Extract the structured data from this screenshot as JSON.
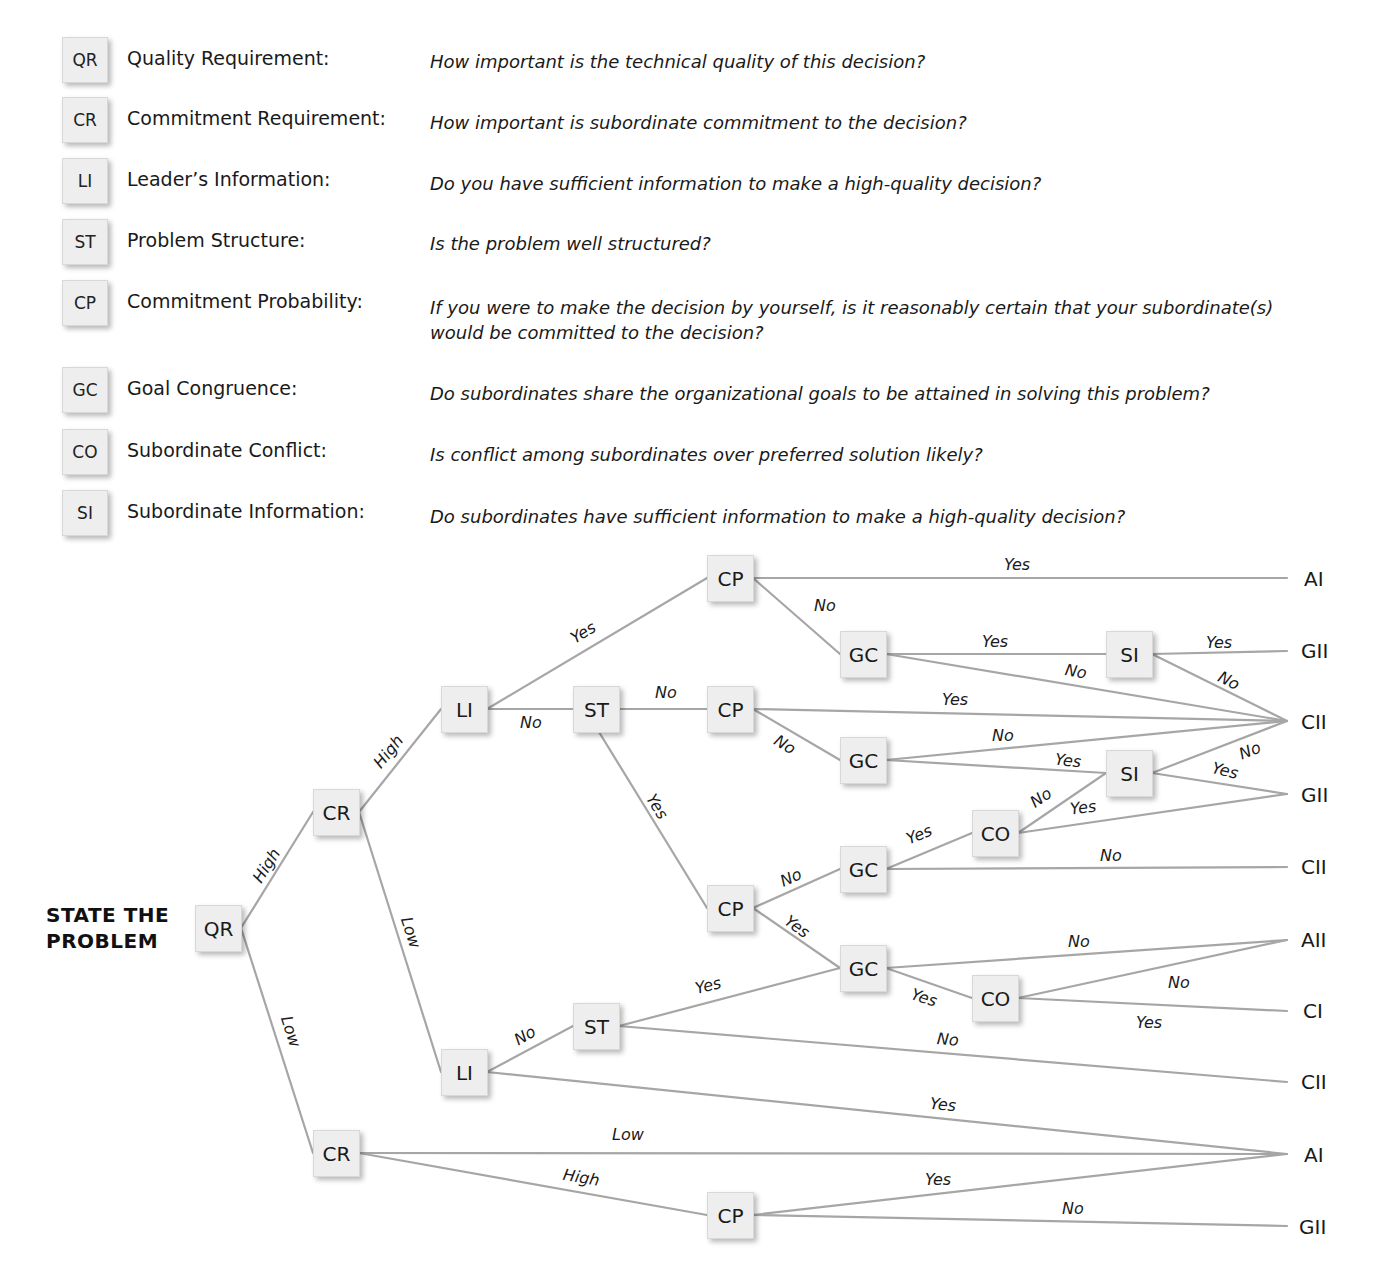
{
  "legend": [
    {
      "code": "QR",
      "name": "Quality Requirement:",
      "question": "How important is the technical quality of this decision?"
    },
    {
      "code": "CR",
      "name": "Commitment Requirement:",
      "question": "How important is subordinate commitment to the decision?"
    },
    {
      "code": "LI",
      "name": "Leader’s Information:",
      "question": "Do you have sufficient information to make a high-quality decision?"
    },
    {
      "code": "ST",
      "name": "Problem Structure:",
      "question": "Is the problem well structured?"
    },
    {
      "code": "CP",
      "name": "Commitment Probability:",
      "question": "If you were to make the decision by yourself, is it reasonably certain that your subordinate(s) would be committed to the decision?"
    },
    {
      "code": "GC",
      "name": "Goal Congruence:",
      "question": "Do subordinates share the organizational goals to be attained in solving this problem?"
    },
    {
      "code": "CO",
      "name": "Subordinate Conflict:",
      "question": "Is conflict among subordinates over preferred solution likely?"
    },
    {
      "code": "SI",
      "name": "Subordinate Information:",
      "question": "Do subordinates have sufficient information to make a high-quality decision?"
    }
  ],
  "start_label": {
    "line1": "STATE THE",
    "line2": "PROBLEM"
  },
  "nodes": {
    "qr": "QR",
    "cr1": "CR",
    "cr2": "CR",
    "li1": "LI",
    "li2": "LI",
    "st1": "ST",
    "st2": "ST",
    "cpa": "CP",
    "cpb": "CP",
    "cpc": "CP",
    "cpd": "CP",
    "gca": "GC",
    "gcb": "GC",
    "gcc": "GC",
    "gcd": "GC",
    "sia": "SI",
    "sib": "SI",
    "coa": "CO",
    "cob": "CO"
  },
  "outcomes": [
    "AI",
    "GII",
    "CII",
    "GII",
    "CII",
    "AII",
    "CI",
    "CII",
    "AI",
    "GII"
  ],
  "edge_labels": {
    "qr_cr1": "High",
    "qr_cr2": "Low",
    "cr1_li1": "High",
    "cr1_li2": "Low",
    "li1_cpa": "Yes",
    "li1_st1": "No",
    "st1_cpb": "No",
    "st1_cpc": "Yes",
    "cpa_ai": "Yes",
    "cpa_gca": "No",
    "gca_sia": "Yes",
    "gca_cii": "No",
    "sia_gii": "Yes",
    "sia_cii": "No",
    "cpb_cii": "Yes",
    "cpb_gcb": "No",
    "gcb_cii": "No",
    "gcb_sib": "Yes",
    "sib_cii": "No",
    "sib_gii": "Yes",
    "coa_sib": "No",
    "coa_gii": "Yes",
    "gcc_coa": "Yes",
    "gcc_cii": "No",
    "cpc_gcc": "No",
    "cpc_gcd": "Yes",
    "gcd_aii": "No",
    "gcd_cob": "Yes",
    "cob_aii": "No",
    "cob_ci": "Yes",
    "st2_gcd": "Yes",
    "st2_cii": "No",
    "li2_st2": "No",
    "li2_ai": "Yes",
    "cr2_ai": "Low",
    "cr2_cpd": "High",
    "cpd_ai": "Yes",
    "cpd_gii": "No"
  },
  "colors": {
    "line": "#a6a6a6",
    "box_fill": "#eeeeee",
    "text": "#1a1a1a"
  }
}
